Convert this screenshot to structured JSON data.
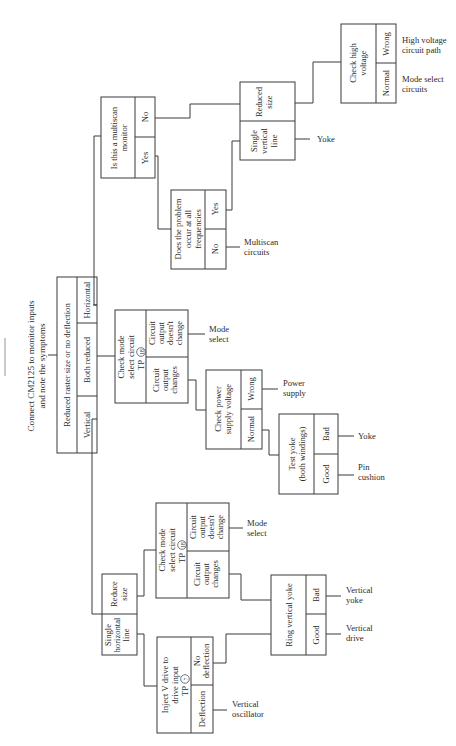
{
  "title": {
    "line1": "Connect CM2125 to monitor inputs",
    "line2": "and note the symptoms"
  },
  "root": {
    "question": "Reduced raster size or no deflection",
    "options": [
      "Vertical",
      "Both reduced",
      "Horizontal"
    ]
  },
  "multiscan": {
    "question_l1": "Is this a multiscan",
    "question_l2": "monitor",
    "yes": "Yes",
    "no": "No"
  },
  "frequencies": {
    "question_l1": "Does the problem",
    "question_l2": "occur at all",
    "question_l3": "frequencies",
    "yes": "Yes",
    "no": "No",
    "no_result_l1": "Multiscan",
    "no_result_l2": "circuits"
  },
  "symptom_h": {
    "reduced_l1": "Reduced",
    "reduced_l2": "size",
    "single_l1": "Single",
    "single_l2": "vertical",
    "single_l3": "line",
    "single_result": "Yoke"
  },
  "high_voltage": {
    "question_l1": "Check high",
    "question_l2": "voltage",
    "wrong": "Wrong",
    "normal": "Normal",
    "wrong_result_l1": "High voltage",
    "wrong_result_l2": "circuit path",
    "normal_result_l1": "Mode select",
    "normal_result_l2": "circuits"
  },
  "mode_select_both": {
    "question_l1": "Check mode",
    "question_l2": "select circuit",
    "question_l3": "TP",
    "tp_number": "18",
    "no_change_l1": "Circuit",
    "no_change_l2": "output",
    "no_change_l3": "doesn't",
    "no_change_l4": "change",
    "changes_l1": "Circuit",
    "changes_l2": "output",
    "changes_l3": "changes",
    "no_change_result_l1": "Mode",
    "no_change_result_l2": "select"
  },
  "power_supply": {
    "question_l1": "Check power",
    "question_l2": "supply voltage",
    "wrong": "Wrong",
    "normal": "Normal",
    "wrong_result_l1": "Power",
    "wrong_result_l2": "supply"
  },
  "test_yoke": {
    "question_l1": "Test yoke",
    "question_l2": "(both windings)",
    "bad": "Bad",
    "good": "Good",
    "bad_result": "Yoke",
    "good_result_l1": "Pin",
    "good_result_l2": "cushion"
  },
  "symptom_v": {
    "reduce_l1": "Reduce",
    "reduce_l2": "size",
    "single_l1": "Single",
    "single_l2": "horizontal",
    "single_l3": "line"
  },
  "mode_select_vertical": {
    "question_l1": "Check mode",
    "question_l2": "select circuit",
    "question_l3": "TP",
    "tp_number": "18",
    "no_change_l1": "Circuit",
    "no_change_l2": "output",
    "no_change_l3": "doesn't",
    "no_change_l4": "change",
    "changes_l1": "Circuit",
    "changes_l2": "output",
    "changes_l3": "changes",
    "no_change_result_l1": "Mode",
    "no_change_result_l2": "select"
  },
  "ring_yoke": {
    "question": "Ring vertical yoke",
    "bad": "Bad",
    "good": "Good",
    "bad_result_l1": "Vertical",
    "bad_result_l2": "yoke",
    "good_result_l1": "Vertical",
    "good_result_l2": "drive"
  },
  "inject_drive": {
    "question_l1": "Inject V drive to",
    "question_l2": "drive input",
    "question_l3": "TP",
    "tp_number": "7",
    "no_deflection_l1": "No",
    "no_deflection_l2": "deflection",
    "deflection": "Deflection",
    "deflection_result_l1": "Vertical",
    "deflection_result_l2": "oscillator"
  }
}
